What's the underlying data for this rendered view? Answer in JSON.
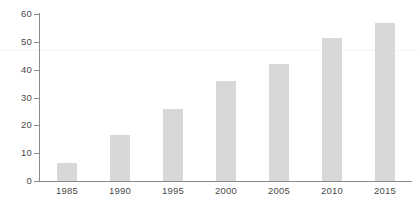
{
  "chart_data": {
    "type": "bar",
    "title": "",
    "subtitle": "",
    "xlabel": "",
    "ylabel": "",
    "categories": [
      "1985",
      "1990",
      "1995",
      "2000",
      "2005",
      "2010",
      "2015"
    ],
    "values": [
      6.3,
      16.4,
      25.7,
      35.8,
      42.1,
      51.2,
      56.8
    ],
    "series": [
      {
        "name": "",
        "values": [
          6.3,
          16.4,
          25.7,
          35.8,
          42.1,
          51.2,
          56.8
        ]
      }
    ],
    "ylim": [
      0,
      60
    ],
    "yticks": [
      0,
      10,
      20,
      30,
      40,
      50,
      60
    ],
    "ytick_labels": [
      "0",
      "10",
      "20",
      "30",
      "40",
      "50",
      "60"
    ],
    "xtick_labels": [
      "1985",
      "1990",
      "1995",
      "2000",
      "2005",
      "2010",
      "2015"
    ],
    "grid": false,
    "legend": null,
    "legend_position": "none",
    "annotations": [],
    "colors": {
      "bar_fill": "#d8d8d8",
      "axis": "#8a8a8a",
      "tick_label": "#4a4a4a",
      "background": "#ffffff",
      "faint_rule": "#f4f4f4"
    }
  }
}
